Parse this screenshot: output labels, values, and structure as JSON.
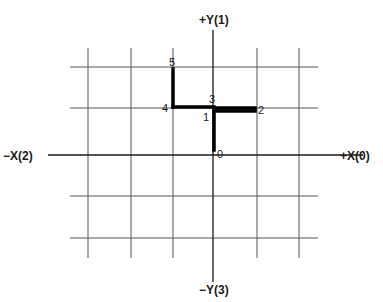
{
  "diagram": {
    "type": "coordinate-grid-path",
    "axes": {
      "pos_x": "+X(0)",
      "pos_y": "+Y(1)",
      "neg_x": "−X(2)",
      "neg_y": "−Y(3)"
    },
    "grid": {
      "columns": 6,
      "rows": 5,
      "line_color": "#555555",
      "axis_color": "#1a1a1a",
      "path_color": "#000000"
    },
    "points": [
      {
        "label": "0",
        "grid_x": 0,
        "grid_y": 0
      },
      {
        "label": "1",
        "grid_x": 0,
        "grid_y": 1
      },
      {
        "label": "2",
        "grid_x": 1,
        "grid_y": 1
      },
      {
        "label": "3",
        "grid_x": 0,
        "grid_y": 1
      },
      {
        "label": "4",
        "grid_x": -1,
        "grid_y": 1
      },
      {
        "label": "5",
        "grid_x": -1,
        "grid_y": 2
      }
    ],
    "path_sequence": [
      "0",
      "1",
      "2",
      "3",
      "4",
      "5"
    ]
  }
}
